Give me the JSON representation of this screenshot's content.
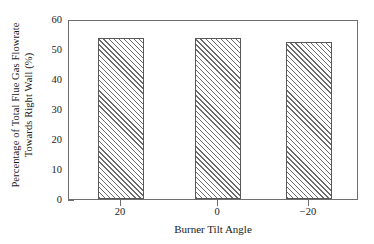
{
  "chart_data": {
    "type": "bar",
    "title": "",
    "subtitle": "",
    "xlabel": "Burner Tilt Angle",
    "ylabel": "Percentage of Total Flue Gas Flowrate Towards Right Wall (%)",
    "ylabel_line1": "Percentage of Total Flue Gas Flowrate",
    "ylabel_line2": "Towards Right Wall (%)",
    "categories": [
      "20",
      "0",
      "−20"
    ],
    "values": [
      53.8,
      53.8,
      52.2
    ],
    "ylim": [
      0,
      60
    ],
    "yticks": [
      0,
      10,
      20,
      30,
      40,
      50,
      60
    ],
    "ytick_labels": [
      "0",
      "10",
      "20",
      "30",
      "40",
      "50",
      "60"
    ],
    "xtick_labels": [
      "20",
      "0",
      "−20"
    ],
    "grid": false,
    "legend": null,
    "legend_position": "none",
    "bar_fill": "hatched-diagonal",
    "bar_edge_color": "#585858",
    "frame_color": "#6e6e6e",
    "background": "#ffffff"
  }
}
